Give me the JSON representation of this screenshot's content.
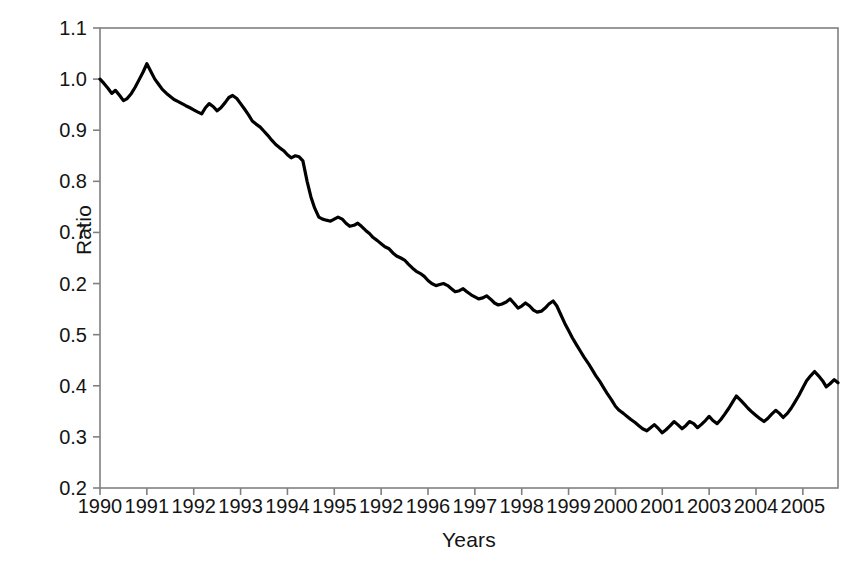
{
  "chart_data": {
    "type": "line",
    "title": "",
    "xlabel": "Years",
    "ylabel": "Ratio",
    "grid": false,
    "legend": null,
    "xlim": [
      1990.0,
      2005.75
    ],
    "ylim": [
      0.2,
      1.1
    ],
    "ytick_labels": [
      "1.1",
      "1.0",
      "0.9",
      "0.8",
      "0.7",
      "0.2",
      "0.5",
      "0.4",
      "0.3",
      "0.2"
    ],
    "ytick_values": [
      1.1,
      1.0,
      0.9,
      0.8,
      0.7,
      0.6,
      0.5,
      0.4,
      0.3,
      0.2
    ],
    "xtick_labels": [
      "1990",
      "1991",
      "1992",
      "1993",
      "1994",
      "1995",
      "1992",
      "1996",
      "1997",
      "1998",
      "1999",
      "2000",
      "2001",
      "2003",
      "2004",
      "2005"
    ],
    "xtick_values": [
      1990,
      1991,
      1992,
      1993,
      1994,
      1995,
      1996,
      1997,
      1998,
      1999,
      2000,
      2001,
      2002,
      2003,
      2004,
      2005
    ],
    "line_color": "#000000",
    "frame_color": "#808080",
    "background": "#ffffff",
    "series": [
      {
        "name": "Ratio",
        "x": [
          1990.0,
          1990.08,
          1990.17,
          1990.25,
          1990.33,
          1990.42,
          1990.5,
          1990.58,
          1990.67,
          1990.75,
          1990.83,
          1990.92,
          1991.0,
          1991.08,
          1991.17,
          1991.25,
          1991.33,
          1991.42,
          1991.5,
          1991.58,
          1991.67,
          1991.75,
          1991.83,
          1991.92,
          1992.0,
          1992.08,
          1992.17,
          1992.25,
          1992.33,
          1992.42,
          1992.5,
          1992.58,
          1992.67,
          1992.75,
          1992.83,
          1992.92,
          1993.0,
          1993.08,
          1993.17,
          1993.25,
          1993.33,
          1993.42,
          1993.5,
          1993.58,
          1993.67,
          1993.75,
          1993.83,
          1993.92,
          1994.0,
          1994.08,
          1994.17,
          1994.25,
          1994.33,
          1994.42,
          1994.5,
          1994.58,
          1994.67,
          1994.75,
          1994.83,
          1994.92,
          1995.0,
          1995.08,
          1995.17,
          1995.25,
          1995.33,
          1995.42,
          1995.5,
          1995.58,
          1995.67,
          1995.75,
          1995.83,
          1995.92,
          1996.0,
          1996.08,
          1996.17,
          1996.25,
          1996.33,
          1996.42,
          1996.5,
          1996.58,
          1996.67,
          1996.75,
          1996.83,
          1996.92,
          1997.0,
          1997.08,
          1997.17,
          1997.25,
          1997.33,
          1997.42,
          1997.5,
          1997.58,
          1997.67,
          1997.75,
          1997.83,
          1997.92,
          1998.0,
          1998.08,
          1998.17,
          1998.25,
          1998.33,
          1998.42,
          1998.5,
          1998.58,
          1998.67,
          1998.75,
          1998.83,
          1998.92,
          1999.0,
          1999.08,
          1999.17,
          1999.25,
          1999.33,
          1999.42,
          1999.5,
          1999.58,
          1999.67,
          1999.75,
          1999.83,
          1999.92,
          2000.0,
          2000.08,
          2000.17,
          2000.25,
          2000.33,
          2000.42,
          2000.5,
          2000.58,
          2000.67,
          2000.75,
          2000.83,
          2000.92,
          2001.0,
          2001.08,
          2001.17,
          2001.25,
          2001.33,
          2001.42,
          2001.5,
          2001.58,
          2001.67,
          2001.75,
          2001.83,
          2001.92,
          2002.0,
          2002.08,
          2002.17,
          2002.25,
          2002.33,
          2002.42,
          2002.5,
          2002.58,
          2002.67,
          2002.75,
          2002.83,
          2002.92,
          2003.0,
          2003.08,
          2003.17,
          2003.25,
          2003.33,
          2003.42,
          2003.5,
          2003.58,
          2003.67,
          2003.75,
          2003.83,
          2003.92,
          2004.0,
          2004.08,
          2004.17,
          2004.25,
          2004.33,
          2004.42,
          2004.5,
          2004.58,
          2004.67,
          2004.75,
          2004.83,
          2004.92,
          2005.0,
          2005.08,
          2005.17,
          2005.25,
          2005.33,
          2005.42,
          2005.5,
          2005.58,
          2005.67,
          2005.75
        ],
        "values": [
          1.0,
          0.992,
          0.982,
          0.972,
          0.978,
          0.968,
          0.958,
          0.962,
          0.972,
          0.984,
          0.998,
          1.014,
          1.03,
          1.016,
          1.0,
          0.99,
          0.98,
          0.972,
          0.966,
          0.96,
          0.956,
          0.952,
          0.948,
          0.944,
          0.94,
          0.936,
          0.932,
          0.944,
          0.952,
          0.946,
          0.938,
          0.944,
          0.954,
          0.964,
          0.968,
          0.962,
          0.952,
          0.942,
          0.93,
          0.918,
          0.912,
          0.906,
          0.898,
          0.89,
          0.88,
          0.872,
          0.866,
          0.86,
          0.852,
          0.846,
          0.85,
          0.848,
          0.84,
          0.8,
          0.77,
          0.748,
          0.73,
          0.726,
          0.724,
          0.722,
          0.726,
          0.73,
          0.726,
          0.718,
          0.712,
          0.714,
          0.718,
          0.712,
          0.704,
          0.698,
          0.69,
          0.684,
          0.678,
          0.672,
          0.668,
          0.66,
          0.654,
          0.65,
          0.646,
          0.638,
          0.63,
          0.624,
          0.62,
          0.614,
          0.606,
          0.6,
          0.596,
          0.598,
          0.6,
          0.596,
          0.59,
          0.584,
          0.586,
          0.59,
          0.584,
          0.578,
          0.574,
          0.57,
          0.572,
          0.576,
          0.57,
          0.562,
          0.558,
          0.56,
          0.564,
          0.57,
          0.562,
          0.552,
          0.556,
          0.562,
          0.556,
          0.548,
          0.544,
          0.546,
          0.552,
          0.56,
          0.566,
          0.556,
          0.54,
          0.522,
          0.508,
          0.494,
          0.48,
          0.468,
          0.456,
          0.444,
          0.432,
          0.42,
          0.408,
          0.396,
          0.384,
          0.372,
          0.36,
          0.352,
          0.346,
          0.34,
          0.334,
          0.328,
          0.322,
          0.316,
          0.312,
          0.318,
          0.324,
          0.316,
          0.308,
          0.314,
          0.322,
          0.33,
          0.324,
          0.316,
          0.322,
          0.33,
          0.326,
          0.318,
          0.324,
          0.332,
          0.34,
          0.332,
          0.326,
          0.334,
          0.344,
          0.356,
          0.368,
          0.38,
          0.372,
          0.364,
          0.356,
          0.348,
          0.342,
          0.336,
          0.33,
          0.336,
          0.344,
          0.352,
          0.346,
          0.338,
          0.346,
          0.356,
          0.368,
          0.382,
          0.396,
          0.41,
          0.42,
          0.428,
          0.42,
          0.41,
          0.398,
          0.404,
          0.412,
          0.406
        ]
      }
    ]
  }
}
